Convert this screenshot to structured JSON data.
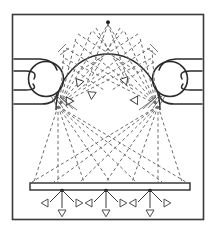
{
  "figure": {
    "canvas": {
      "width": 216,
      "height": 232
    },
    "colors": {
      "frame_stroke": "#3a3a3a",
      "solid_stroke": "#2b2b2b",
      "dashed_stroke": "#6b6b6b",
      "hatch_stroke": "#555555",
      "arrow_stroke": "#3a3a3a",
      "arrow_fill": "#ffffff",
      "node_fill": "#1a1a1a",
      "background": "#ffffff"
    },
    "frame": {
      "x": 12,
      "y": 14,
      "width": 192,
      "height": 206
    },
    "dome": {
      "label": "dome-arch",
      "apex": {
        "x": 108,
        "y": 22
      },
      "left_base": {
        "x": 56,
        "y": 108
      },
      "right_base": {
        "x": 160,
        "y": 108
      },
      "radius": 52
    },
    "bulbs": [
      {
        "label": "left-bulb",
        "cx": 46,
        "cy": 78,
        "r": 17
      },
      {
        "label": "right-bulb",
        "cx": 170,
        "cy": 78,
        "r": 17
      }
    ],
    "horizontal_lines": {
      "left": [
        {
          "y": 59,
          "x1": 14,
          "x2": 44
        },
        {
          "y": 74,
          "x1": 14,
          "x2": 36
        },
        {
          "y": 88,
          "x1": 14,
          "x2": 36
        },
        {
          "y": 103,
          "x1": 14,
          "x2": 46
        }
      ],
      "right": [
        {
          "y": 59,
          "x1": 172,
          "x2": 202
        },
        {
          "y": 74,
          "x1": 180,
          "x2": 202
        },
        {
          "y": 88,
          "x1": 180,
          "x2": 202
        },
        {
          "y": 103,
          "x1": 170,
          "x2": 202
        }
      ]
    },
    "bar": {
      "label": "detector-bar",
      "x": 30,
      "y": 183,
      "width": 160,
      "height": 7
    },
    "emission_nodes": [
      {
        "label": "node-left",
        "x": 62,
        "y": 190
      },
      {
        "label": "node-center",
        "x": 106,
        "y": 190
      },
      {
        "label": "node-right",
        "x": 150,
        "y": 190
      }
    ],
    "node_arrows": {
      "count_per_node": 3,
      "directions": [
        "down-left",
        "down",
        "down-right"
      ],
      "length": 22
    },
    "dome_arrowheads": [
      {
        "x": 78,
        "y": 82,
        "angle": 115
      },
      {
        "x": 70,
        "y": 97,
        "angle": 125
      },
      {
        "x": 122,
        "y": 80,
        "angle": 65
      },
      {
        "x": 131,
        "y": 96,
        "angle": 58
      },
      {
        "x": 92,
        "y": 95,
        "angle": 95
      }
    ],
    "ray_fans": {
      "upper_left_source": {
        "x": 58,
        "y": 103
      },
      "upper_right_source": {
        "x": 158,
        "y": 103
      },
      "lower_left_source": {
        "x": 58,
        "y": 106
      },
      "lower_right_source": {
        "x": 158,
        "y": 106
      },
      "description": "dashed rays fan upward into dome and downward crossing to the bar"
    },
    "hatch_fans": [
      {
        "label": "left-hatch",
        "origin_x": 57,
        "origin_y": 100
      },
      {
        "label": "right-hatch",
        "origin_x": 159,
        "origin_y": 100
      }
    ]
  }
}
